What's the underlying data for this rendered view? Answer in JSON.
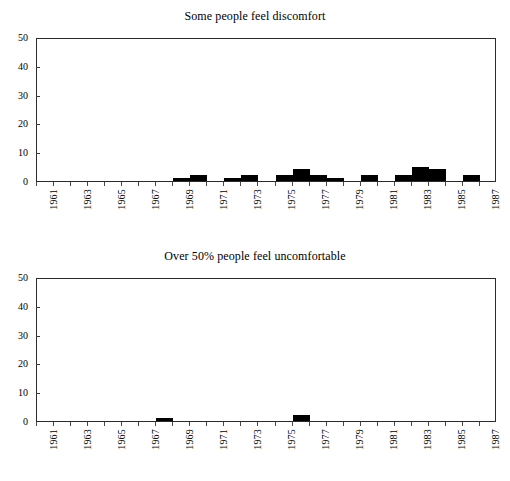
{
  "page": {
    "background": "#ffffff",
    "ink": "#000000"
  },
  "charts": [
    {
      "id": "chart-top",
      "title": "Some people feel discomfort",
      "ylabels": [
        "0",
        "10",
        "20",
        "30",
        "40",
        "50"
      ],
      "xlabels": [
        "1961",
        "1963",
        "1965",
        "1967",
        "1969",
        "1971",
        "1973",
        "1975",
        "1977",
        "1979",
        "1981",
        "1983",
        "1985",
        "1987"
      ]
    },
    {
      "id": "chart-bottom",
      "title": "Over 50% people feel uncomfortable",
      "ylabels": [
        "0",
        "10",
        "20",
        "30",
        "40",
        "50"
      ],
      "xlabels": [
        "1961",
        "1963",
        "1965",
        "1967",
        "1969",
        "1971",
        "1973",
        "1975",
        "1977",
        "1979",
        "1981",
        "1983",
        "1985",
        "1987"
      ]
    }
  ],
  "chart_data": [
    {
      "type": "bar",
      "title": "Some people feel discomfort",
      "xlabel": "",
      "ylabel": "",
      "ylim": [
        0,
        50
      ],
      "yticks": [
        0,
        10,
        20,
        30,
        40,
        50
      ],
      "xlim": [
        1960.5,
        1987.5
      ],
      "xticklabels": [
        "1961",
        "1963",
        "1965",
        "1967",
        "1969",
        "1971",
        "1973",
        "1975",
        "1977",
        "1979",
        "1981",
        "1983",
        "1985",
        "1987"
      ],
      "grid": false,
      "legend": false,
      "bar_color": "#000000",
      "categories": [
        1961,
        1962,
        1963,
        1964,
        1965,
        1966,
        1967,
        1968,
        1969,
        1970,
        1971,
        1972,
        1973,
        1974,
        1975,
        1976,
        1977,
        1978,
        1979,
        1980,
        1981,
        1982,
        1983,
        1984,
        1985,
        1986,
        1987
      ],
      "values": [
        0,
        0,
        0,
        0,
        0,
        0,
        0,
        0,
        1,
        2,
        0,
        1,
        2,
        0,
        2,
        4,
        2,
        1,
        0,
        2,
        0,
        2,
        5,
        4,
        0,
        2,
        0
      ]
    },
    {
      "type": "bar",
      "title": "Over 50% people feel uncomfortable",
      "xlabel": "",
      "ylabel": "",
      "ylim": [
        0,
        50
      ],
      "yticks": [
        0,
        10,
        20,
        30,
        40,
        50
      ],
      "xlim": [
        1960.5,
        1987.5
      ],
      "xticklabels": [
        "1961",
        "1963",
        "1965",
        "1967",
        "1969",
        "1971",
        "1973",
        "1975",
        "1977",
        "1979",
        "1981",
        "1983",
        "1985",
        "1987"
      ],
      "grid": false,
      "legend": false,
      "bar_color": "#000000",
      "categories": [
        1961,
        1962,
        1963,
        1964,
        1965,
        1966,
        1967,
        1968,
        1969,
        1970,
        1971,
        1972,
        1973,
        1974,
        1975,
        1976,
        1977,
        1978,
        1979,
        1980,
        1981,
        1982,
        1983,
        1984,
        1985,
        1986,
        1987
      ],
      "values": [
        0,
        0,
        0,
        0,
        0,
        0,
        0,
        1,
        0,
        0,
        0,
        0,
        0,
        0,
        0,
        2,
        0,
        0,
        0,
        0,
        0,
        0,
        0,
        0,
        0,
        0,
        0
      ]
    }
  ]
}
